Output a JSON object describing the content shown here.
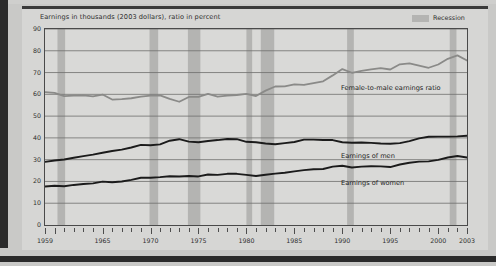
{
  "chart_data": {
    "type": "line",
    "title": "Earnings in thousands (2003 dollars), ratio in percent",
    "xlabel": "",
    "ylabel": "",
    "xlim": [
      1959,
      2003
    ],
    "ylim": [
      0,
      90
    ],
    "ytick_step": 10,
    "grid": true,
    "legend_position": "top-right",
    "yticks": [
      "90",
      "80",
      "70",
      "60",
      "50",
      "40",
      "30",
      "20",
      "10",
      "0"
    ],
    "xticks": [
      "1959",
      "1965",
      "1970",
      "1975",
      "1980",
      "1985",
      "1990",
      "1995",
      "2000",
      "2003"
    ],
    "legend": [
      {
        "label": "Recession",
        "color": "#b4b4b2",
        "kind": "band"
      }
    ],
    "x": [
      1959,
      1960,
      1961,
      1962,
      1963,
      1964,
      1965,
      1966,
      1967,
      1968,
      1969,
      1970,
      1971,
      1972,
      1973,
      1974,
      1975,
      1976,
      1977,
      1978,
      1979,
      1980,
      1981,
      1982,
      1983,
      1984,
      1985,
      1986,
      1987,
      1988,
      1989,
      1990,
      1991,
      1992,
      1993,
      1994,
      1995,
      1996,
      1997,
      1998,
      1999,
      2000,
      2001,
      2002,
      2003
    ],
    "series": [
      {
        "name": "Female-to-male earnings ratio",
        "color": "#8a8a88",
        "width": 1.8,
        "values": [
          61.0,
          60.7,
          59.2,
          59.4,
          59.5,
          59.1,
          59.9,
          57.6,
          57.8,
          58.2,
          58.9,
          59.4,
          59.5,
          57.9,
          56.6,
          58.8,
          58.8,
          60.2,
          58.9,
          59.4,
          59.7,
          60.2,
          59.2,
          61.7,
          63.6,
          63.7,
          64.6,
          64.3,
          65.2,
          66.0,
          68.7,
          71.6,
          69.9,
          70.8,
          71.5,
          72.0,
          71.4,
          73.8,
          74.2,
          73.2,
          72.2,
          73.7,
          76.3,
          77.9,
          75.5
        ]
      },
      {
        "name": "Earnings of men",
        "color": "#1b1b1b",
        "width": 1.9,
        "values": [
          29.0,
          29.6,
          30.1,
          30.9,
          31.6,
          32.3,
          33.2,
          34.0,
          34.6,
          35.6,
          36.8,
          36.6,
          37.0,
          38.7,
          39.4,
          38.3,
          38.0,
          38.6,
          39.0,
          39.5,
          39.4,
          38.2,
          38.0,
          37.4,
          37.1,
          37.6,
          38.1,
          39.2,
          39.2,
          39.0,
          39.0,
          38.0,
          37.8,
          37.9,
          37.7,
          37.4,
          37.3,
          37.6,
          38.5,
          39.8,
          40.5,
          40.6,
          40.6,
          40.7,
          41.0
        ]
      },
      {
        "name": "Earnings of women",
        "color": "#1b1b1b",
        "width": 1.9,
        "values": [
          17.7,
          18.0,
          17.8,
          18.4,
          18.8,
          19.1,
          19.9,
          19.6,
          20.0,
          20.7,
          21.7,
          21.7,
          22.0,
          22.4,
          22.3,
          22.5,
          22.3,
          23.2,
          23.0,
          23.5,
          23.5,
          23.0,
          22.5,
          23.1,
          23.6,
          24.0,
          24.6,
          25.2,
          25.6,
          25.7,
          26.8,
          27.2,
          26.4,
          26.8,
          27.0,
          26.9,
          26.6,
          27.8,
          28.6,
          29.1,
          29.2,
          29.9,
          31.0,
          31.7,
          31.0
        ]
      }
    ],
    "recessions": [
      {
        "start": 1960.3,
        "end": 1961.1
      },
      {
        "start": 1969.9,
        "end": 1970.8
      },
      {
        "start": 1973.9,
        "end": 1975.2
      },
      {
        "start": 1980.0,
        "end": 1980.6
      },
      {
        "start": 1981.5,
        "end": 1982.9
      },
      {
        "start": 1990.5,
        "end": 1991.2
      },
      {
        "start": 2001.2,
        "end": 2001.9
      }
    ],
    "annotations": [
      {
        "text": "Female-to-male earnings ratio",
        "x_px": 341,
        "y_px": 84
      },
      {
        "text": "Earnings of men",
        "x_px": 341,
        "y_px": 152
      },
      {
        "text": "Earnings of women",
        "x_px": 341,
        "y_px": 179
      }
    ]
  },
  "colors": {
    "page_background": "#c9c9c7",
    "card_background": "#d6d6d4",
    "plot_background": "#d9d9d7",
    "grid": "#6f6f6d",
    "frame": "#4a4a4a",
    "recession_band": "#b4b4b2",
    "text": "#2e2e2e"
  }
}
